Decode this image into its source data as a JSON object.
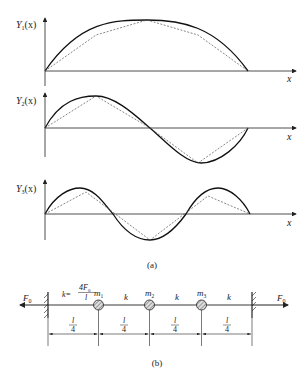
{
  "figure_a": {
    "caption": "(a)",
    "plots": [
      {
        "ylabel": "Y",
        "sub": "1",
        "arg": "(x)",
        "xlabel": "x",
        "mode": 1
      },
      {
        "ylabel": "Y",
        "sub": "2",
        "arg": "(x)",
        "xlabel": "x",
        "mode": 2
      },
      {
        "ylabel": "Y",
        "sub": "3",
        "arg": "(x)",
        "xlabel": "x",
        "mode": 3
      }
    ],
    "legend": {
      "solid": "continuous string mode shape",
      "dashed": "discrete 3-mass approximation"
    }
  },
  "figure_b": {
    "caption": "(b)",
    "force_left": "F",
    "force_left_sub": "0",
    "force_right": "F",
    "force_right_sub": "0",
    "stiffness_prefix": "k=",
    "stiffness_num": "4F",
    "stiffness_num_sub": "0",
    "stiffness_den": "l",
    "spring_label": "k",
    "masses": [
      {
        "label": "m",
        "sub": "1"
      },
      {
        "label": "m",
        "sub": "2"
      },
      {
        "label": "m",
        "sub": "3"
      }
    ],
    "spacing_num": "l",
    "spacing_den": "4"
  }
}
